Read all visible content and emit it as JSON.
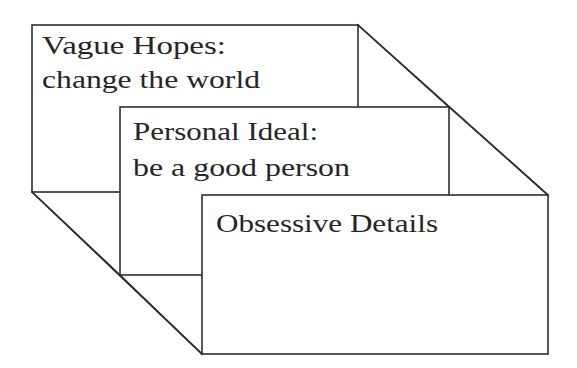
{
  "diagram": {
    "type": "stacked-levels",
    "colors": {
      "line": "#2e2e2e",
      "text": "#262626",
      "background": "#ffffff"
    },
    "boxes": [
      {
        "id": "vague-hopes",
        "line1": "Vague Hopes:",
        "line2": "change the world"
      },
      {
        "id": "personal-ideal",
        "line1": "Personal Ideal:",
        "line2": "be a good person"
      },
      {
        "id": "obsessive-details",
        "line1": "Obsessive Details",
        "line2": ""
      }
    ]
  }
}
